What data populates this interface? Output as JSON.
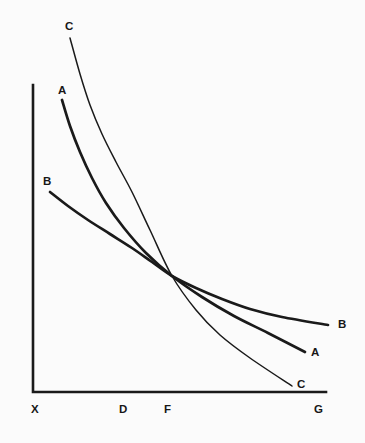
{
  "figure": {
    "background_color": "#fbfbfb",
    "ink_color": "#1a1a1a"
  },
  "axes": {
    "x_axis_label": "",
    "y_axis_label": "",
    "tick_labels": [
      {
        "text": "X",
        "x": 31,
        "y": 404
      },
      {
        "text": "D",
        "x": 119,
        "y": 404
      },
      {
        "text": "F",
        "x": 164,
        "y": 404
      },
      {
        "text": "G",
        "x": 314,
        "y": 404
      }
    ]
  },
  "curve_labels": {
    "c_top": {
      "text": "C",
      "x": 65,
      "y": 21
    },
    "a_top": {
      "text": "A",
      "x": 58,
      "y": 85
    },
    "b_top": {
      "text": "B",
      "x": 43,
      "y": 176
    },
    "b_right": {
      "text": "B",
      "x": 338,
      "y": 319
    },
    "a_right": {
      "text": "A",
      "x": 311,
      "y": 347
    },
    "c_right": {
      "text": "C",
      "x": 297,
      "y": 379
    }
  },
  "chart_data": {
    "type": "line",
    "title": "",
    "subtitle": "",
    "xlabel": "",
    "ylabel": "",
    "grid": false,
    "legend_position": "inline-endpoint-labels",
    "xlim": [
      33,
      326
    ],
    "ylim": [
      392,
      38
    ],
    "axis_tick_categories": [
      "X",
      "D",
      "F",
      "G"
    ],
    "axis_tick_x_positions": [
      33,
      122,
      172,
      320
    ],
    "intersection_point": {
      "x": 172,
      "y": 276,
      "label": "F"
    },
    "series": [
      {
        "name": "A",
        "style": "bold",
        "stroke_width": 2.7,
        "start_label": "A",
        "end_label": "A",
        "points": [
          [
            62,
            100
          ],
          [
            70,
            126
          ],
          [
            80,
            152
          ],
          [
            92,
            178
          ],
          [
            106,
            203
          ],
          [
            124,
            228
          ],
          [
            146,
            253
          ],
          [
            172,
            276
          ],
          [
            202,
            297
          ],
          [
            234,
            316
          ],
          [
            268,
            333
          ],
          [
            305,
            352
          ]
        ]
      },
      {
        "name": "B",
        "style": "bold",
        "stroke_width": 2.7,
        "start_label": "B",
        "end_label": "B",
        "points": [
          [
            50,
            192
          ],
          [
            68,
            206
          ],
          [
            88,
            220
          ],
          [
            110,
            234
          ],
          [
            132,
            248
          ],
          [
            152,
            262
          ],
          [
            172,
            276
          ],
          [
            196,
            288
          ],
          [
            222,
            299
          ],
          [
            250,
            309
          ],
          [
            282,
            317
          ],
          [
            328,
            325
          ]
        ]
      },
      {
        "name": "C",
        "style": "thin",
        "stroke_width": 1.5,
        "start_label": "C",
        "end_label": "C",
        "points": [
          [
            70,
            38
          ],
          [
            80,
            74
          ],
          [
            90,
            105
          ],
          [
            102,
            134
          ],
          [
            116,
            162
          ],
          [
            132,
            192
          ],
          [
            150,
            230
          ],
          [
            172,
            276
          ],
          [
            196,
            310
          ],
          [
            220,
            335
          ],
          [
            250,
            358
          ],
          [
            292,
            386
          ]
        ]
      }
    ]
  }
}
